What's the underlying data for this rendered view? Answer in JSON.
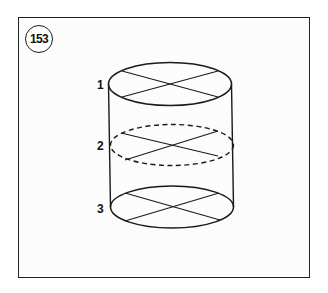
{
  "figure": {
    "number": "153",
    "stroke_color": "#1a1a1a",
    "background_color": "#fcfcfc"
  },
  "cylinder": {
    "levels": [
      {
        "label": "1",
        "style": "solid",
        "cx": 170,
        "cy": 84,
        "rx": 61.5,
        "ry": 21.5
      },
      {
        "label": "2",
        "style": "dashed",
        "cx": 172,
        "cy": 145,
        "rx": 61.5,
        "ry": 20.5
      },
      {
        "label": "3",
        "style": "solid",
        "cx": 172,
        "cy": 207,
        "rx": 61.5,
        "ry": 21
      }
    ],
    "side_lines": {
      "left": {
        "x1": 108.5,
        "y1": 84,
        "x2": 110.5,
        "y2": 207
      },
      "right": {
        "x1": 231.5,
        "y1": 84,
        "x2": 233.5,
        "y2": 207
      }
    }
  }
}
